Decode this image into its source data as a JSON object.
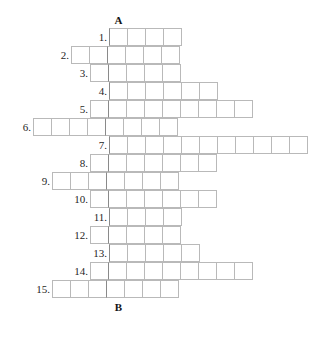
{
  "puzzle": {
    "type": "crossword-acrostic-grid",
    "title": "",
    "top_marker": "A",
    "bottom_marker": "B",
    "geometry": {
      "cell_size": 19,
      "row_height": 18,
      "grid_origin_x": 14,
      "grid_origin_y": 28,
      "key_column_index": 5,
      "columns_total": 16
    },
    "colors": {
      "cell_border": "#b9b9b9",
      "key_border": "#8a8a8a",
      "text": "#1a1a1a",
      "background": "#ffffff"
    },
    "rows": [
      {
        "number": "1.",
        "start_col": 5,
        "length": 4
      },
      {
        "number": "2.",
        "start_col": 3,
        "length": 6
      },
      {
        "number": "3.",
        "start_col": 4,
        "length": 5
      },
      {
        "number": "4.",
        "start_col": 5,
        "length": 6
      },
      {
        "number": "5.",
        "start_col": 4,
        "length": 9
      },
      {
        "number": "6.",
        "start_col": 1,
        "length": 8
      },
      {
        "number": "7.",
        "start_col": 5,
        "length": 11
      },
      {
        "number": "8.",
        "start_col": 4,
        "length": 7
      },
      {
        "number": "9.",
        "start_col": 2,
        "length": 7
      },
      {
        "number": "10.",
        "start_col": 4,
        "length": 7
      },
      {
        "number": "11.",
        "start_col": 5,
        "length": 4
      },
      {
        "number": "12.",
        "start_col": 4,
        "length": 5
      },
      {
        "number": "13.",
        "start_col": 5,
        "length": 5
      },
      {
        "number": "14.",
        "start_col": 4,
        "length": 9
      },
      {
        "number": "15.",
        "start_col": 2,
        "length": 7
      }
    ]
  }
}
